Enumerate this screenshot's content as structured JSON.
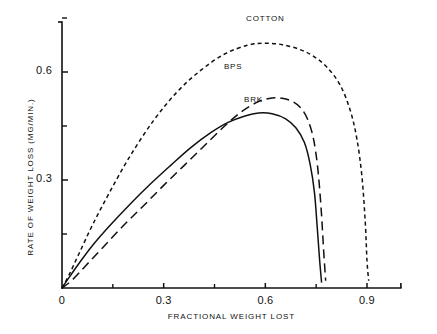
{
  "chart_data": {
    "type": "line",
    "title": "",
    "xlabel": "FRACTIONAL WEIGHT LOST",
    "ylabel": "RATE OF WEIGHT LOSS (MG/MIN.)",
    "xlim": [
      0,
      1.0
    ],
    "ylim": [
      0,
      0.76
    ],
    "grid": false,
    "legend_position": "inline-labels",
    "x_ticks_major": [
      "0",
      "0.3",
      "0.6",
      "0.9"
    ],
    "x_ticks_major_values": [
      0,
      0.3,
      0.6,
      0.9
    ],
    "x_ticks_minor_values": [
      0.15,
      0.45,
      0.75
    ],
    "y_ticks_major": [
      "0.3",
      "0.6"
    ],
    "y_ticks_major_values": [
      0.3,
      0.6
    ],
    "y_ticks_minor_values": [
      0.15,
      0.45,
      0.75
    ],
    "series": [
      {
        "name": "COTTON",
        "style": "short-dash",
        "label_x": 0.6,
        "label_y": 0.745,
        "x": [
          0.0,
          0.02,
          0.05,
          0.09,
          0.14,
          0.2,
          0.27,
          0.34,
          0.41,
          0.48,
          0.55,
          0.6,
          0.65,
          0.7,
          0.74,
          0.78,
          0.82,
          0.85,
          0.87,
          0.885,
          0.895,
          0.9,
          0.905
        ],
        "y": [
          0.0,
          0.035,
          0.095,
          0.175,
          0.265,
          0.365,
          0.465,
          0.545,
          0.605,
          0.65,
          0.675,
          0.68,
          0.676,
          0.663,
          0.645,
          0.615,
          0.565,
          0.495,
          0.415,
          0.31,
          0.18,
          0.075,
          0.02
        ]
      },
      {
        "name": "BPS",
        "style": "long-dash",
        "label_x": 0.505,
        "label_y": 0.61,
        "x": [
          0.0,
          0.03,
          0.07,
          0.12,
          0.18,
          0.24,
          0.3,
          0.36,
          0.42,
          0.48,
          0.53,
          0.58,
          0.62,
          0.65,
          0.68,
          0.705,
          0.725,
          0.742,
          0.755,
          0.765,
          0.772,
          0.778
        ],
        "y": [
          0.0,
          0.022,
          0.062,
          0.112,
          0.172,
          0.228,
          0.285,
          0.34,
          0.395,
          0.45,
          0.49,
          0.518,
          0.528,
          0.527,
          0.518,
          0.5,
          0.468,
          0.415,
          0.33,
          0.215,
          0.105,
          0.02
        ]
      },
      {
        "name": "BRK",
        "style": "solid",
        "label_x": 0.565,
        "label_y": 0.52,
        "x": [
          0.0,
          0.02,
          0.05,
          0.09,
          0.14,
          0.2,
          0.26,
          0.32,
          0.38,
          0.44,
          0.49,
          0.54,
          0.58,
          0.62,
          0.66,
          0.69,
          0.715,
          0.732,
          0.745,
          0.753,
          0.76,
          0.766
        ],
        "y": [
          0.0,
          0.028,
          0.068,
          0.118,
          0.172,
          0.232,
          0.288,
          0.34,
          0.39,
          0.432,
          0.46,
          0.478,
          0.486,
          0.484,
          0.47,
          0.445,
          0.405,
          0.345,
          0.265,
          0.17,
          0.08,
          0.015
        ]
      }
    ]
  }
}
